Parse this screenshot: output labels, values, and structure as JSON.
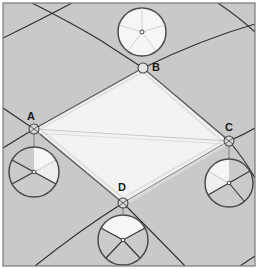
{
  "diagram": {
    "colors": {
      "background": "#c9c9c9",
      "frame": "#7a7a7a",
      "rhombus_fill": "#f3f3f3",
      "rhombus_stroke": "#5a5a5a",
      "grid_line": "#2e2e2e",
      "circle_stroke": "#4a4a4a",
      "light_wedge": "#f6f6f6",
      "dark_wedge": "#cbcbcb"
    },
    "vertices": [
      {
        "id": "A",
        "label": "A",
        "x": 34,
        "y": 129,
        "label_x": 27,
        "label_y": 120
      },
      {
        "id": "B",
        "label": "B",
        "x": 143,
        "y": 68,
        "label_x": 152,
        "label_y": 70
      },
      {
        "id": "C",
        "label": "C",
        "x": 229,
        "y": 141,
        "label_x": 226,
        "label_y": 131
      },
      {
        "id": "D",
        "label": "D",
        "x": 123,
        "y": 203,
        "label_x": 118,
        "label_y": 191
      }
    ],
    "pie_circles": [
      {
        "vertex": "B",
        "cx": 142,
        "cy": 32,
        "r": 24,
        "style": "all-light"
      },
      {
        "vertex": "A",
        "cx": 34,
        "cy": 172,
        "r": 25,
        "style": "light-upper-right"
      },
      {
        "vertex": "C",
        "cx": 229,
        "cy": 183,
        "r": 24,
        "style": "light-upper-left"
      },
      {
        "vertex": "D",
        "cx": 123,
        "cy": 240,
        "r": 25,
        "style": "light-top"
      }
    ]
  }
}
